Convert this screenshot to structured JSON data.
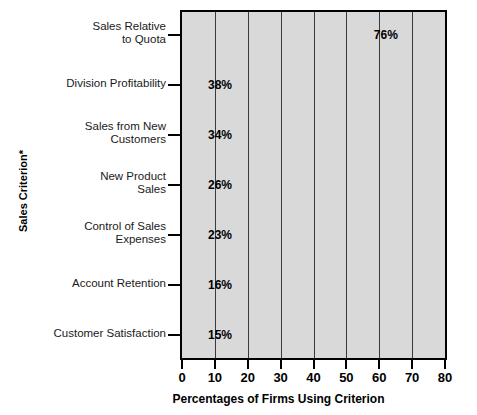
{
  "chart_data": {
    "type": "bar",
    "orientation": "horizontal",
    "title": "",
    "xlabel": "Percentages of Firms Using Criterion",
    "ylabel": "Sales Criterion*",
    "xlim": [
      0,
      80
    ],
    "xticks": [
      0,
      10,
      20,
      30,
      40,
      50,
      60,
      70,
      80
    ],
    "grid": true,
    "legend": "none",
    "value_suffix": "%",
    "categories": [
      "Sales Relative\nto Quota",
      "Division Profitability",
      "Sales from New\nCustomers",
      "New Product\nSales",
      "Control of Sales\nExpenses",
      "Account Retention",
      "Customer Satisfaction"
    ],
    "values": [
      76,
      38,
      34,
      26,
      23,
      16,
      15
    ],
    "value_labels": [
      "76%",
      "38%",
      "34%",
      "26%",
      "23%",
      "16%",
      "15%"
    ],
    "bar_shades": [
      "dark",
      "light",
      "dark",
      "light",
      "dark",
      "dark",
      "dark"
    ],
    "bars": [
      {
        "category": "Sales Relative\nto Quota",
        "value": 76,
        "label": "76%",
        "shade": "dark"
      },
      {
        "category": "Division Profitability",
        "value": 38,
        "label": "38%",
        "shade": "light"
      },
      {
        "category": "Sales from New\nCustomers",
        "value": 34,
        "label": "34%",
        "shade": "dark"
      },
      {
        "category": "New Product\nSales",
        "value": 26,
        "label": "26%",
        "shade": "light"
      },
      {
        "category": "Control of Sales\nExpenses",
        "value": 23,
        "label": "23%",
        "shade": "dark"
      },
      {
        "category": "Account Retention",
        "value": 16,
        "label": "16%",
        "shade": "dark"
      },
      {
        "category": "Customer Satisfaction",
        "value": 15,
        "label": "15%",
        "shade": "dark"
      }
    ]
  },
  "colors": {
    "plot_background": "#d9d9d9",
    "axis": "#000000",
    "gridline": "#3a3a3a",
    "bar_dark": "#6d6d6d",
    "bar_light": "#c6c6c6",
    "text": "#000000"
  }
}
